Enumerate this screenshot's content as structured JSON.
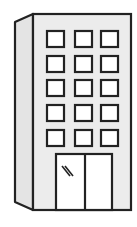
{
  "image": {
    "subject": "office-building-icon",
    "colors": {
      "background": "#ffffff",
      "stroke": "#222222",
      "wall_fill": "#ececec",
      "side_fill": "#e4e4e4",
      "window_fill": "#ffffff",
      "door_fill": "#ffffff"
    },
    "windows": {
      "columns": 3,
      "rows": 5
    },
    "door": {
      "panels": 2
    }
  }
}
